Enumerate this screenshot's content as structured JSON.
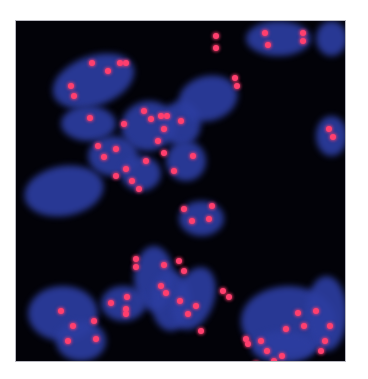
{
  "image": {
    "subject": "fluorescence microscopy of cell nuclei with red signal dots",
    "background_color": "#020208",
    "nucleus_color": "#2c3da0",
    "signal_color": "#ff3f6e",
    "nuclei": [
      {
        "x": 35,
        "y": 35,
        "w": 85,
        "h": 50,
        "r": -20
      },
      {
        "x": 45,
        "y": 85,
        "w": 55,
        "h": 35,
        "r": 0
      },
      {
        "x": 105,
        "y": 80,
        "w": 55,
        "h": 50,
        "r": -10
      },
      {
        "x": 145,
        "y": 80,
        "w": 40,
        "h": 45,
        "r": 0
      },
      {
        "x": 72,
        "y": 115,
        "w": 50,
        "h": 40,
        "r": 0
      },
      {
        "x": 105,
        "y": 135,
        "w": 40,
        "h": 35,
        "r": 0
      },
      {
        "x": 150,
        "y": 120,
        "w": 40,
        "h": 40,
        "r": 0
      },
      {
        "x": 8,
        "y": 145,
        "w": 80,
        "h": 50,
        "r": -10
      },
      {
        "x": 162,
        "y": 55,
        "w": 60,
        "h": 45,
        "r": -15
      },
      {
        "x": 230,
        "y": 0,
        "w": 65,
        "h": 35,
        "r": 0
      },
      {
        "x": 300,
        "y": 0,
        "w": 31,
        "h": 35,
        "r": 0
      },
      {
        "x": 300,
        "y": 95,
        "w": 31,
        "h": 40,
        "r": 0
      },
      {
        "x": 163,
        "y": 180,
        "w": 45,
        "h": 35,
        "r": 0
      },
      {
        "x": 118,
        "y": 225,
        "w": 40,
        "h": 65,
        "r": 0
      },
      {
        "x": 135,
        "y": 250,
        "w": 40,
        "h": 60,
        "r": 0
      },
      {
        "x": 158,
        "y": 245,
        "w": 40,
        "h": 65,
        "r": 20
      },
      {
        "x": 12,
        "y": 265,
        "w": 70,
        "h": 55,
        "r": 0
      },
      {
        "x": 40,
        "y": 300,
        "w": 50,
        "h": 40,
        "r": 0
      },
      {
        "x": 85,
        "y": 265,
        "w": 45,
        "h": 35,
        "r": 0
      },
      {
        "x": 225,
        "y": 265,
        "w": 95,
        "h": 70,
        "r": 0
      },
      {
        "x": 290,
        "y": 255,
        "w": 41,
        "h": 75,
        "r": 0
      },
      {
        "x": 235,
        "y": 310,
        "w": 65,
        "h": 32,
        "r": 0
      }
    ],
    "signals": [
      [
        76,
        42
      ],
      [
        92,
        50
      ],
      [
        104,
        42
      ],
      [
        110,
        42
      ],
      [
        55,
        65
      ],
      [
        58,
        75
      ],
      [
        74,
        97
      ],
      [
        108,
        103
      ],
      [
        128,
        90
      ],
      [
        135,
        98
      ],
      [
        145,
        95
      ],
      [
        151,
        95
      ],
      [
        148,
        108
      ],
      [
        165,
        100
      ],
      [
        142,
        120
      ],
      [
        148,
        132
      ],
      [
        82,
        125
      ],
      [
        100,
        128
      ],
      [
        88,
        136
      ],
      [
        110,
        148
      ],
      [
        130,
        140
      ],
      [
        100,
        155
      ],
      [
        158,
        150
      ],
      [
        177,
        135
      ],
      [
        123,
        168
      ],
      [
        116,
        160
      ],
      [
        200,
        15
      ],
      [
        200,
        27
      ],
      [
        249,
        12
      ],
      [
        252,
        24
      ],
      [
        287,
        12
      ],
      [
        287,
        20
      ],
      [
        219,
        57
      ],
      [
        221,
        65
      ],
      [
        313,
        108
      ],
      [
        317,
        116
      ],
      [
        168,
        188
      ],
      [
        196,
        185
      ],
      [
        193,
        198
      ],
      [
        176,
        200
      ],
      [
        120,
        238
      ],
      [
        120,
        246
      ],
      [
        148,
        244
      ],
      [
        163,
        240
      ],
      [
        168,
        250
      ],
      [
        145,
        265
      ],
      [
        150,
        272
      ],
      [
        164,
        280
      ],
      [
        172,
        293
      ],
      [
        45,
        290
      ],
      [
        78,
        300
      ],
      [
        95,
        282
      ],
      [
        110,
        293
      ],
      [
        111,
        276
      ],
      [
        110,
        288
      ],
      [
        57,
        305
      ],
      [
        52,
        320
      ],
      [
        80,
        318
      ],
      [
        180,
        285
      ],
      [
        185,
        310
      ],
      [
        207,
        270
      ],
      [
        213,
        276
      ],
      [
        232,
        323
      ],
      [
        245,
        320
      ],
      [
        270,
        308
      ],
      [
        282,
        292
      ],
      [
        300,
        290
      ],
      [
        314,
        305
      ],
      [
        288,
        305
      ],
      [
        251,
        330
      ],
      [
        258,
        340
      ],
      [
        230,
        348
      ],
      [
        266,
        335
      ],
      [
        240,
        343
      ],
      [
        305,
        330
      ],
      [
        309,
        320
      ],
      [
        230,
        318
      ]
    ]
  }
}
